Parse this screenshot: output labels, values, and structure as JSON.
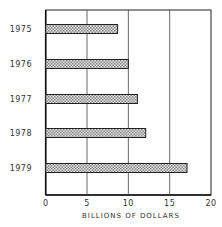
{
  "chart_data": {
    "type": "bar",
    "orientation": "horizontal",
    "title": "",
    "xlabel": "BILLIONS OF DOLLARS",
    "ylabel": "",
    "categories": [
      "1975",
      "1976",
      "1977",
      "1978",
      "1979"
    ],
    "values": [
      8.7,
      10.0,
      11.1,
      12.1,
      17.1
    ],
    "xlim": [
      0,
      20
    ],
    "xticks": [
      "0",
      "5",
      "10",
      "15",
      "20"
    ],
    "grid": "vertical lines at 5, 10, 15",
    "legend": "none",
    "bar_fill": "crosshatch gray pattern",
    "colors": {
      "axis": "#222222",
      "bar_fill": "#bdbdbd",
      "bar_edge": "#222222"
    }
  }
}
